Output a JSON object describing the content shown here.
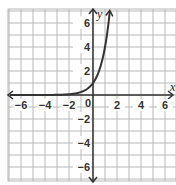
{
  "chart_data": {
    "type": "line",
    "title": "",
    "xlabel": "x",
    "ylabel": "y",
    "xlim": [
      -7,
      7
    ],
    "ylim": [
      -7,
      7
    ],
    "grid": true,
    "x_ticks": [
      -6,
      -4,
      -2,
      0,
      2,
      4,
      6
    ],
    "y_ticks": [
      -6,
      -4,
      -2,
      2,
      4,
      6
    ],
    "x_tick_labels": [
      "-6",
      "-4",
      "-2",
      "0",
      "2",
      "4",
      "6"
    ],
    "y_tick_labels": [
      "-6",
      "-4",
      "-2",
      "2",
      "4",
      "6"
    ],
    "origin_label": "0",
    "series": [
      {
        "name": "y = 4^x",
        "function": "4^x",
        "x": [
          -7,
          -6,
          -5,
          -4,
          -3,
          -2,
          -1,
          -0.5,
          0,
          0.5,
          1,
          1.25,
          1.4
        ],
        "y": [
          0.0001,
          0.0002,
          0.001,
          0.004,
          0.016,
          0.0625,
          0.25,
          0.5,
          1,
          2,
          4,
          5.66,
          6.96
        ],
        "color": "#333333",
        "left_arrow": true,
        "right_arrow": true
      }
    ],
    "y_intercept": 1,
    "asymptote": "y = 0"
  },
  "labels": {
    "x_axis": "x",
    "y_axis": "y",
    "origin": "0",
    "x_ticks": [
      "−6",
      "−4",
      "−2",
      "2",
      "4",
      "6"
    ],
    "y_ticks": [
      "6",
      "4",
      "2",
      "−2",
      "−4",
      "−6"
    ]
  },
  "colors": {
    "grid": "#b8b8b8",
    "axis": "#333333",
    "curve": "#333333"
  }
}
